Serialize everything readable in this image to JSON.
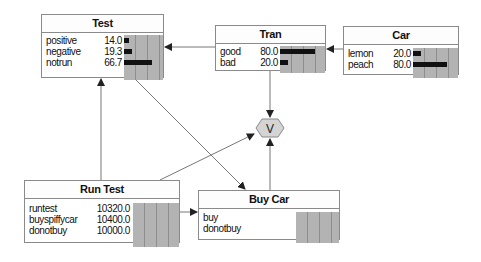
{
  "nodes": {
    "test": {
      "title": "Test",
      "states": [
        {
          "label": "positive",
          "value": "14.0",
          "pct": 14.0
        },
        {
          "label": "negative",
          "value": "19.3",
          "pct": 19.3
        },
        {
          "label": "notrun",
          "value": "66.7",
          "pct": 66.7
        }
      ]
    },
    "tran": {
      "title": "Tran",
      "states": [
        {
          "label": "good",
          "value": "80.0",
          "pct": 80.0
        },
        {
          "label": "bad",
          "value": "20.0",
          "pct": 20.0
        }
      ]
    },
    "car": {
      "title": "Car",
      "states": [
        {
          "label": "lemon",
          "value": "20.0",
          "pct": 20.0
        },
        {
          "label": "peach",
          "value": "80.0",
          "pct": 80.0
        }
      ]
    },
    "run_test": {
      "title": "Run Test",
      "states": [
        {
          "label": "runtest",
          "value": "10320.0"
        },
        {
          "label": "buyspiffycar",
          "value": "10400.0"
        },
        {
          "label": "donotbuy",
          "value": "10000.0"
        }
      ]
    },
    "buy_car": {
      "title": "Buy Car",
      "states": [
        {
          "label": "buy",
          "value": ""
        },
        {
          "label": "donotbuy",
          "value": ""
        }
      ]
    },
    "utility": {
      "label": "V"
    }
  },
  "colors": {
    "border": "#8a8a8a",
    "grid": "#b3b3b3",
    "bar": "#111111",
    "utility_fill": "#d4d4d4"
  }
}
